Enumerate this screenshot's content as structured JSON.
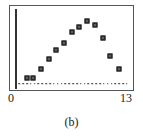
{
  "figure": {
    "caption": "(b)",
    "axis": {
      "x_tick_left": "0",
      "x_tick_right": "13"
    },
    "colors": {
      "marker": "#2a2a2a",
      "frame": "#555555",
      "axis": "#333333",
      "background": "#ffffff"
    }
  },
  "chart_data": {
    "type": "scatter",
    "title": "",
    "subtitle": "",
    "xlabel": "",
    "ylabel": "",
    "xlim": [
      0,
      13
    ],
    "ylim": [
      0,
      1
    ],
    "grid": false,
    "legend": false,
    "tick_labels": {
      "x": [
        "0",
        "13"
      ],
      "y": []
    },
    "annotations": [
      "(b)"
    ],
    "series": [
      {
        "name": "peaked-series",
        "marker": "open-square",
        "x": [
          1.0,
          1.8,
          2.7,
          3.6,
          4.5,
          5.4,
          6.3,
          7.2,
          8.1,
          9.0,
          9.9,
          10.8,
          11.8
        ],
        "y": [
          0.1,
          0.1,
          0.22,
          0.36,
          0.48,
          0.58,
          0.72,
          0.8,
          0.88,
          0.82,
          0.64,
          0.4,
          0.22
        ]
      },
      {
        "name": "baseline-series",
        "marker": "dot",
        "x": [
          0.15,
          0.6,
          1.05,
          1.5,
          1.95,
          2.4,
          2.85,
          3.3,
          3.75,
          4.2,
          4.65,
          5.1,
          5.55,
          6.0,
          6.45,
          6.9,
          7.35,
          7.8,
          8.25,
          8.7,
          9.15,
          9.6,
          10.05,
          10.5,
          10.95,
          11.4,
          11.85,
          12.3,
          12.75
        ],
        "y": [
          0.02,
          0.02,
          0.02,
          0.02,
          0.02,
          0.02,
          0.02,
          0.02,
          0.02,
          0.02,
          0.02,
          0.02,
          0.02,
          0.02,
          0.02,
          0.02,
          0.02,
          0.02,
          0.02,
          0.02,
          0.02,
          0.02,
          0.02,
          0.02,
          0.02,
          0.02,
          0.02,
          0.02,
          0.02
        ]
      }
    ]
  }
}
